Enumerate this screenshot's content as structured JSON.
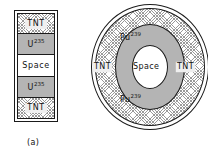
{
  "figure": {
    "panels": [
      {
        "id": "a",
        "caption": "(a)",
        "type": "gun-type-assembly",
        "layers": [
          {
            "label": "TNT",
            "sup": "",
            "fill": "hatch"
          },
          {
            "label": "U",
            "sup": "235",
            "fill": "gray"
          },
          {
            "label": "Space",
            "sup": "",
            "fill": "white"
          },
          {
            "label": "U",
            "sup": "235",
            "fill": "gray"
          },
          {
            "label": "TNT",
            "sup": "",
            "fill": "hatch"
          }
        ]
      },
      {
        "id": "b",
        "caption": "(b)",
        "type": "implosion-sphere",
        "rings": [
          {
            "label": "TNT",
            "sup": "",
            "fill": "hatch"
          },
          {
            "label": "Pu",
            "sup": "239",
            "fill": "gray"
          },
          {
            "label": "Space",
            "sup": "",
            "fill": "white"
          }
        ],
        "labels": {
          "pu_top": "Pu",
          "pu_top_sup": "239",
          "pu_bottom": "Pu",
          "pu_bottom_sup": "239",
          "space": "Space",
          "tnt_left": "TNT",
          "tnt_right": "TNT"
        }
      }
    ]
  },
  "colors": {
    "hatch_line": "#9a9a9a",
    "gray_fill": "#b4b4b4",
    "white_fill": "#ffffff",
    "outline": "#1a1a1a",
    "text": "#111111",
    "background": "#ffffff"
  }
}
